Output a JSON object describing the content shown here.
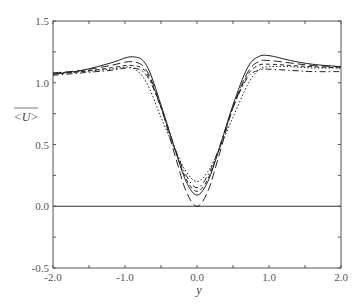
{
  "chart_data": {
    "type": "line",
    "title": "",
    "xlabel": "y",
    "ylabel": "<U>",
    "xlim": [
      -2.0,
      2.0
    ],
    "ylim": [
      -0.5,
      1.5
    ],
    "grid": false,
    "legend": null,
    "x_ticks": [
      "-2.0",
      "-1.0",
      "0.0",
      "1.0",
      "2.0"
    ],
    "y_ticks": [
      "-0.5",
      "0.0",
      "0.5",
      "1.0",
      "1.5"
    ],
    "reference_line": {
      "y": 0.0,
      "style": "solid"
    },
    "x": [
      -2.0,
      -1.6,
      -1.2,
      -0.9,
      -0.7,
      -0.5,
      -0.3,
      -0.15,
      0.0,
      0.15,
      0.3,
      0.5,
      0.7,
      0.85,
      1.0,
      1.3,
      1.6,
      2.0
    ],
    "series": [
      {
        "name": "solid",
        "style": "solid",
        "values": [
          1.07,
          1.1,
          1.16,
          1.21,
          1.14,
          0.82,
          0.45,
          0.2,
          0.09,
          0.2,
          0.45,
          0.82,
          1.12,
          1.21,
          1.22,
          1.18,
          1.15,
          1.13
        ]
      },
      {
        "name": "long-dash",
        "style": "longdash",
        "values": [
          1.08,
          1.1,
          1.14,
          1.17,
          1.1,
          0.8,
          0.4,
          0.12,
          0.0,
          0.12,
          0.4,
          0.8,
          1.08,
          1.17,
          1.18,
          1.16,
          1.14,
          1.13
        ]
      },
      {
        "name": "short-dash",
        "style": "dash",
        "values": [
          1.07,
          1.09,
          1.12,
          1.14,
          1.08,
          0.8,
          0.45,
          0.22,
          0.12,
          0.22,
          0.45,
          0.8,
          1.06,
          1.14,
          1.15,
          1.14,
          1.13,
          1.12
        ]
      },
      {
        "name": "dash-dot",
        "style": "dashdot",
        "values": [
          1.06,
          1.08,
          1.1,
          1.12,
          1.06,
          0.8,
          0.46,
          0.25,
          0.15,
          0.25,
          0.46,
          0.8,
          1.04,
          1.1,
          1.11,
          1.1,
          1.09,
          1.09
        ]
      },
      {
        "name": "dotted",
        "style": "dotted",
        "values": [
          1.08,
          1.09,
          1.11,
          1.12,
          1.0,
          0.72,
          0.45,
          0.28,
          0.2,
          0.28,
          0.45,
          0.72,
          0.98,
          1.1,
          1.13,
          1.13,
          1.12,
          1.12
        ]
      }
    ]
  }
}
